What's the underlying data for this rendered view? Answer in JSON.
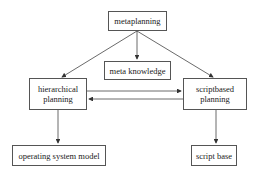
{
  "diagram": {
    "nodes": [
      {
        "id": "metaplanning",
        "lines": [
          "metaplanning"
        ]
      },
      {
        "id": "meta_knowledge",
        "lines": [
          "meta knowledge"
        ]
      },
      {
        "id": "hierarchical_planning",
        "lines": [
          "hierarchical",
          "planning"
        ]
      },
      {
        "id": "scriptbased_planning",
        "lines": [
          "scriptbased",
          "planning"
        ]
      },
      {
        "id": "operating_system_model",
        "lines": [
          "operating system model"
        ]
      },
      {
        "id": "script_base",
        "lines": [
          "script base"
        ]
      }
    ],
    "edges": [
      {
        "from": "metaplanning",
        "to": "hierarchical_planning"
      },
      {
        "from": "metaplanning",
        "to": "meta_knowledge"
      },
      {
        "from": "metaplanning",
        "to": "scriptbased_planning"
      },
      {
        "from": "hierarchical_planning",
        "to": "scriptbased_planning"
      },
      {
        "from": "scriptbased_planning",
        "to": "hierarchical_planning"
      },
      {
        "from": "hierarchical_planning",
        "to": "operating_system_model"
      },
      {
        "from": "scriptbased_planning",
        "to": "script_base"
      }
    ]
  }
}
